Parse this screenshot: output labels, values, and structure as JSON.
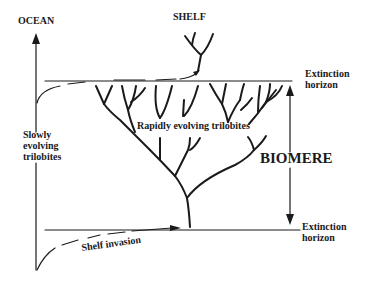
{
  "diagram": {
    "labels": {
      "ocean": "OCEAN",
      "shelf": "SHELF",
      "extinction_top_line1": "Extinction",
      "extinction_top_line2": "horizon",
      "extinction_bottom_line1": "Extinction",
      "extinction_bottom_line2": "horizon",
      "slowly_line1": "Slowly",
      "slowly_line2": "evolving",
      "slowly_line3": "trilobites",
      "rapidly": "Rapidly evolving trilobites",
      "biomere": "BIOMERE",
      "shelf_invasion": "Shelf invasion"
    },
    "colors": {
      "ink": "#1a1a1a",
      "background": "#ffffff"
    }
  }
}
